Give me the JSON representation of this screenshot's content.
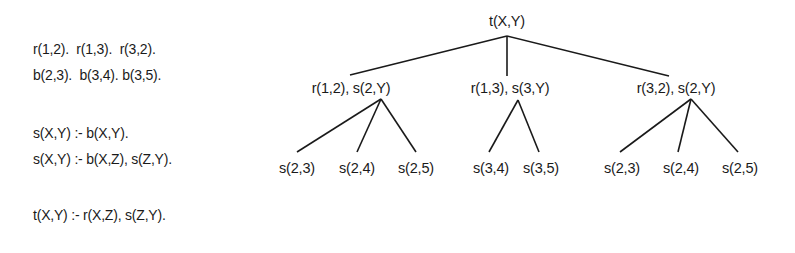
{
  "program": {
    "facts_r": "r(1,2).  r(1,3).  r(3,2).",
    "facts_b": "b(2,3).  b(3,4). b(3,5).",
    "rule_s1": "s(X,Y) :- b(X,Y).",
    "rule_s2": "s(X,Y) :- b(X,Z), s(Z,Y).",
    "rule_t": "t(X,Y) :- r(X,Z), s(Z,Y)."
  },
  "tree": {
    "root": "t(X,Y)",
    "level1": [
      "r(1,2), s(2,Y)",
      "r(1,3), s(3,Y)",
      "r(3,2), s(2,Y)"
    ],
    "level2": {
      "branch0": [
        "s(2,3)",
        "s(2,4)",
        "s(2,5)"
      ],
      "branch1": [
        "s(3,4)",
        "s(3,5)"
      ],
      "branch2": [
        "s(2,3)",
        "s(2,4)",
        "s(2,5)"
      ]
    }
  }
}
